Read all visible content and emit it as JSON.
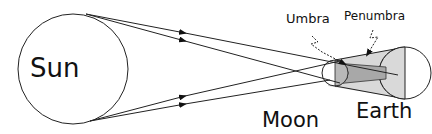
{
  "diagram": {
    "type": "solar-eclipse-geometry",
    "labels": {
      "sun": "Sun",
      "moon": "Moon",
      "earth": "Earth",
      "umbra": "Umbra",
      "penumbra": "Penumbra"
    },
    "colors": {
      "line": "#222222",
      "penumbra_fill": "#d9d9d9",
      "umbra_fill": "#a8a8a8",
      "background": "#ffffff"
    }
  }
}
